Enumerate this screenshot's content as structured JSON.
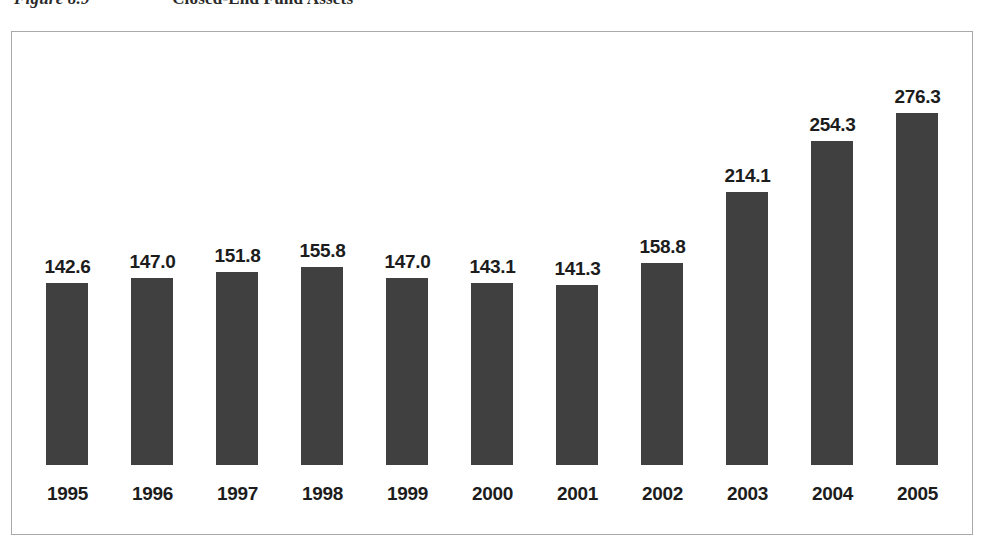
{
  "figure": {
    "caption_number": "Figure 8.9",
    "caption_title": "Closed-End Fund Assets"
  },
  "chart_data": {
    "type": "bar",
    "title": "Closed-End Fund Assets",
    "xlabel": "",
    "ylabel": "",
    "ylim": [
      0,
      300
    ],
    "grid": false,
    "legend": "none",
    "bar_color": "#404040",
    "categories": [
      "1995",
      "1996",
      "1997",
      "1998",
      "1999",
      "2000",
      "2001",
      "2002",
      "2003",
      "2004",
      "2005"
    ],
    "values": [
      142.6,
      147.0,
      151.8,
      155.8,
      147.0,
      143.1,
      141.3,
      158.8,
      214.1,
      254.3,
      276.3
    ],
    "value_labels": [
      "142.6",
      "147.0",
      "151.8",
      "155.8",
      "147.0",
      "143.1",
      "141.3",
      "158.8",
      "214.1",
      "254.3",
      "276.3"
    ]
  }
}
